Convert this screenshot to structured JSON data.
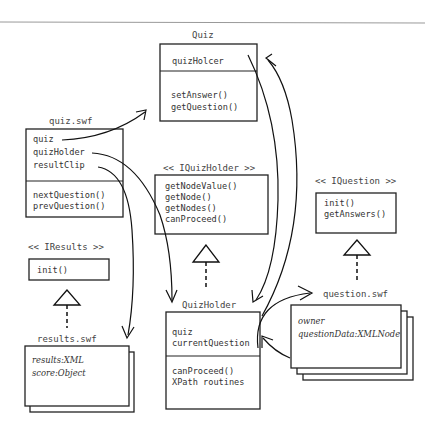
{
  "diagram": {
    "quiz": {
      "title": "Quiz",
      "attributes": [
        "quizHolcer"
      ],
      "methods": [
        "setAnswer()",
        "getQuestion()"
      ]
    },
    "quiz_swf": {
      "title": "quiz.swf",
      "attributes": [
        "quiz",
        "quizHolder",
        "resultClip"
      ],
      "methods": [
        "nextQuestion()",
        "prevQuestion()"
      ]
    },
    "iquizholder": {
      "title": "<< IQuizHolder >>",
      "methods": [
        "getNodeValue()",
        "getNode()",
        "getNodes()",
        "canProceed()"
      ]
    },
    "iquestion": {
      "title": "<< IQuestion >>",
      "methods": [
        "init()",
        "getAnswers()"
      ]
    },
    "iresults": {
      "title": "<< IResults >>",
      "methods": [
        "init()"
      ]
    },
    "quizholder": {
      "title": "QuizHolder",
      "attributes": [
        "quiz",
        "currentQuestion"
      ],
      "methods": [
        "canProceed()",
        "XPath routines"
      ]
    },
    "question_swf": {
      "title": "question.swf",
      "attributes": [
        "owner",
        "questionData:XMLNode"
      ]
    },
    "results_swf": {
      "title": "results.swf",
      "attributes": [
        "results:XML",
        "score:Object"
      ]
    }
  }
}
